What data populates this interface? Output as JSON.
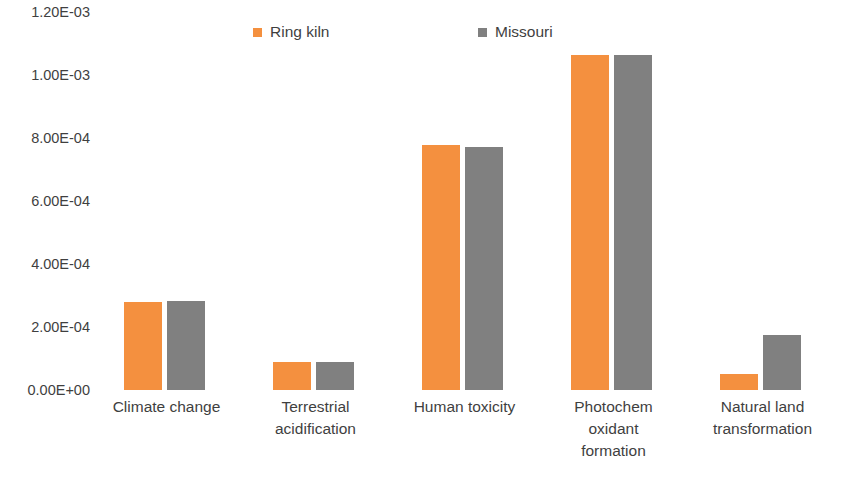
{
  "chart_data": {
    "type": "bar",
    "title": "",
    "xlabel": "",
    "ylabel": "",
    "ylim": [
      0,
      0.0012
    ],
    "grid": false,
    "legend_position": "top",
    "ytick_labels": [
      "1.20E-03",
      "1.00E-03",
      "8.00E-04",
      "6.00E-04",
      "4.00E-04",
      "2.00E-04",
      "0.00E+00"
    ],
    "ytick_values": [
      0.0012,
      0.001,
      0.0008,
      0.0006,
      0.0004,
      0.0002,
      0
    ],
    "categories": [
      "Climate change",
      "Terrestrial acidification",
      "Human toxicity",
      "Photochem oxidant formation",
      "Natural land transformation"
    ],
    "category_lines": [
      [
        "Climate change"
      ],
      [
        "Terrestrial",
        "acidification"
      ],
      [
        "Human toxicity"
      ],
      [
        "Photochem",
        "oxidant",
        "formation"
      ],
      [
        "Natural land",
        "transformation"
      ]
    ],
    "series": [
      {
        "name": "Ring kiln",
        "color": "#F4903F",
        "values": [
          0.000279,
          8.89e-05,
          0.000778,
          0.001063,
          5.08e-05
        ]
      },
      {
        "name": "Missouri",
        "color": "#808080",
        "values": [
          0.000282,
          8.89e-05,
          0.000771,
          0.001063,
          0.000175
        ]
      }
    ]
  },
  "legend": {
    "entries": [
      {
        "label": "Ring kiln",
        "color": "#F4903F"
      },
      {
        "label": "Missouri",
        "color": "#808080"
      }
    ]
  }
}
